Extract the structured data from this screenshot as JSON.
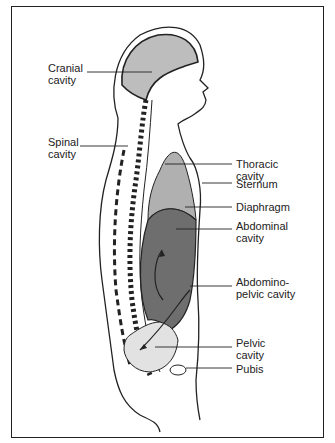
{
  "diagram": {
    "type": "anatomical-sagittal-section",
    "colors": {
      "outline": "#222222",
      "cranial_fill": "#bdbdbd",
      "thoracic_fill": "#b0b0b0",
      "abdominal_fill": "#6e6e6e",
      "pelvic_fill": "#e2e2e2",
      "background": "#ffffff"
    },
    "labels": [
      {
        "id": "cranial",
        "text": "Cranial\ncavity"
      },
      {
        "id": "spinal",
        "text": "Spinal\ncavity"
      },
      {
        "id": "thoracic",
        "text": "Thoracic\ncavity"
      },
      {
        "id": "sternum",
        "text": "Sternum"
      },
      {
        "id": "diaphragm",
        "text": "Diaphragm"
      },
      {
        "id": "abdominal",
        "text": "Abdominal\ncavity"
      },
      {
        "id": "abdominopelvic",
        "text": "Abdomino-\npelvic cavity"
      },
      {
        "id": "pelvic",
        "text": "Pelvic\ncavity"
      },
      {
        "id": "pubis",
        "text": "Pubis"
      }
    ]
  }
}
